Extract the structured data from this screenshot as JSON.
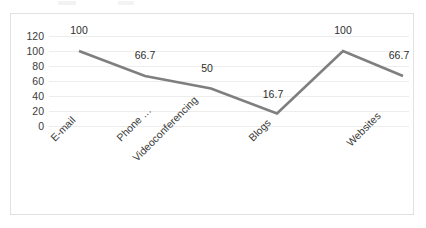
{
  "chart_data": {
    "type": "line",
    "title": "",
    "subtitle": "",
    "xlabel": "",
    "ylabel": "",
    "categories": [
      "E-mail",
      "Phone …",
      "Videoconferencing",
      "Blogs",
      "",
      "Websites"
    ],
    "values": [
      100,
      66.7,
      50,
      16.7,
      100,
      66.7
    ],
    "point_labels": [
      "100",
      "66.7",
      "50",
      "16.7",
      "100",
      "66.7"
    ],
    "series": [
      {
        "name": "",
        "values": [
          100,
          66.7,
          50,
          16.7,
          100,
          66.7
        ],
        "color": "#7f7f7f"
      }
    ],
    "ylim": [
      0,
      120
    ],
    "yticks": [
      0,
      20,
      40,
      60,
      80,
      100,
      120
    ],
    "ytick_labels": [
      "0",
      "20",
      "40",
      "60",
      "80",
      "100",
      "120"
    ],
    "grid": true,
    "grid_axis": "y",
    "legend": false,
    "legend_position": "none",
    "data_labels_shown": true,
    "xtick_label_rotation": -45,
    "markers": false
  },
  "style": {
    "line_color": "#7f7f7f",
    "gridline_color": "#ededed",
    "text_color": "#3b3b3b",
    "border_color": "#e2e2e2",
    "background": "#ffffff"
  }
}
